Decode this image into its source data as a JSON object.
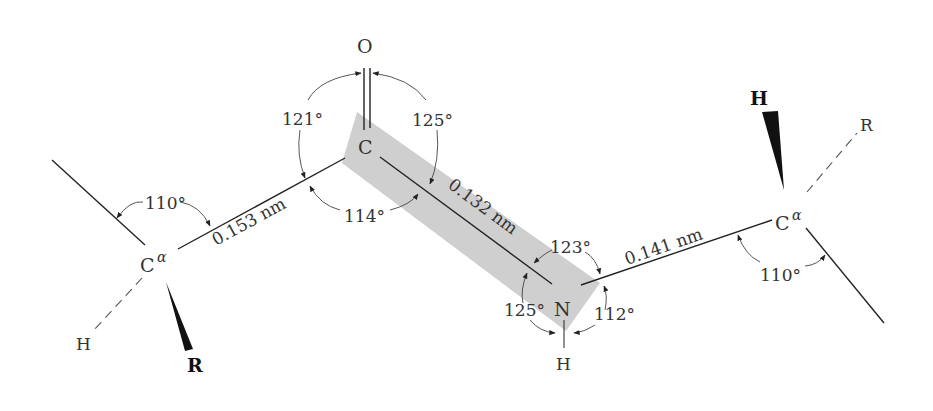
{
  "diagram": {
    "atoms": {
      "carbonyl_o": "O",
      "carbonyl_c": "C",
      "amide_n": "N",
      "amide_h": "H",
      "left_calpha": "C",
      "right_calpha": "C",
      "alpha": "α",
      "left_h": "H",
      "left_r": "R",
      "right_h": "H",
      "right_r": "R"
    },
    "bond_lengths": {
      "calpha_c": "0.153 nm",
      "c_n": "0.132 nm",
      "n_calpha": "0.141 nm"
    },
    "angles": {
      "left_calpha": "110°",
      "o_c_calpha": "121°",
      "o_c_n": "125°",
      "calpha_c_n": "114°",
      "c_n_calpha": "123°",
      "c_n_h": "125°",
      "calpha_n_h": "112°",
      "right_calpha": "110°"
    },
    "colors": {
      "plane_shade": "#cfcfcf",
      "bond": "#222222"
    }
  }
}
